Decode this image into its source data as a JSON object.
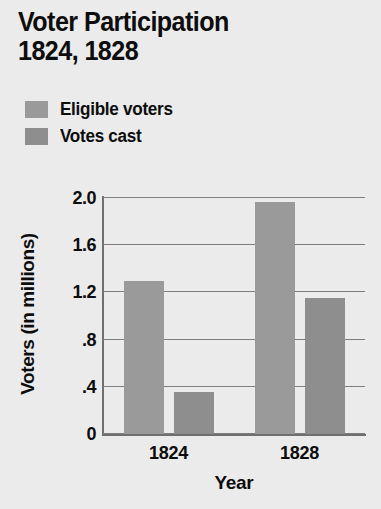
{
  "title": {
    "line1": "Voter Participation",
    "line2": "1824, 1828"
  },
  "legend": {
    "position": "top-left",
    "items": [
      {
        "label": "Eligible voters",
        "color": "#9a9a9a"
      },
      {
        "label": "Votes cast",
        "color": "#8e8e8e"
      }
    ]
  },
  "axes": {
    "y_title": "Voters (in millions)",
    "x_title": "Year",
    "y_ticks": [
      "2.0",
      "1.6",
      "1.2",
      ".8",
      ".4",
      "0"
    ],
    "x_ticks": [
      "1824",
      "1828"
    ]
  },
  "colors": {
    "background": "#ebebeb",
    "eligible": "#9a9a9a",
    "cast": "#8e8e8e",
    "gridline": "#7e7e7e",
    "axis": "#6f6f6f",
    "text": "#0d0d0d"
  },
  "chart_data": {
    "type": "bar",
    "title": "Voter Participation 1824, 1828",
    "xlabel": "Year",
    "ylabel": "Voters (in millions)",
    "categories": [
      "1824",
      "1828"
    ],
    "series": [
      {
        "name": "Eligible voters",
        "values": [
          1.3,
          1.97
        ],
        "color": "#9a9a9a"
      },
      {
        "name": "Votes cast",
        "values": [
          0.36,
          1.15
        ],
        "color": "#8e8e8e"
      }
    ],
    "ylim": [
      0,
      2.0
    ],
    "ytick_values": [
      2.0,
      1.6,
      1.2,
      0.8,
      0.4,
      0
    ],
    "ytick_labels": [
      "2.0",
      "1.6",
      "1.2",
      ".8",
      ".4",
      "0"
    ],
    "grid": true,
    "grid_axis": "y",
    "legend_position": "above-plot-left"
  }
}
